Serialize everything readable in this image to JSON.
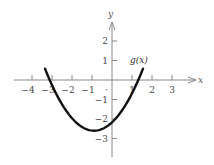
{
  "chart_data": {
    "type": "line",
    "title": "",
    "xlabel": "x",
    "ylabel": "y",
    "xlim": [
      -4.5,
      4
    ],
    "ylim": [
      -4,
      3
    ],
    "x_ticks": [
      -4,
      -3,
      -2,
      -1,
      1,
      2,
      3
    ],
    "y_ticks": [
      2,
      1,
      -1,
      -2,
      -3
    ],
    "x_tick_labels": [
      "−4",
      "−3",
      "−2",
      "−1",
      "1",
      "2",
      "3"
    ],
    "y_tick_labels": [
      "2",
      "1",
      "−1",
      "−2",
      "−3"
    ],
    "origin_marker": "·",
    "grid": false,
    "series": [
      {
        "name": "g(x)",
        "description": "Upward-opening parabola, vertex near (-0.9, -2.6), roots near x = -3.1 and x = 1.3, y-intercept near -2.2",
        "x": [
          -3.35,
          -3,
          -2.5,
          -2,
          -1.5,
          -1,
          -0.9,
          -0.5,
          0,
          0.5,
          1,
          1.3,
          1.55
        ],
        "y": [
          0.6,
          0.07,
          -1.24,
          -1.96,
          -2.41,
          -2.59,
          -2.6,
          -2.52,
          -2.17,
          -1.56,
          -0.68,
          0.0,
          0.6
        ]
      }
    ],
    "annotations": [
      {
        "text": "g(x)",
        "x": 1.2,
        "y": 1
      }
    ]
  },
  "labels": {
    "x_axis": "x",
    "y_axis": "y",
    "function": "g(x)",
    "origin": "·"
  }
}
